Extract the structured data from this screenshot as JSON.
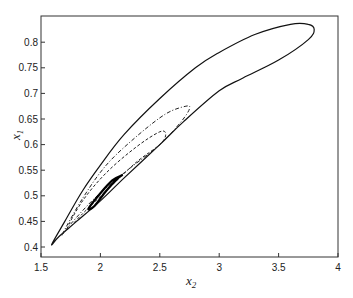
{
  "chart_data": {
    "type": "line",
    "title": "",
    "xlabel": "x",
    "xlabel_sub": "2",
    "ylabel": "x",
    "ylabel_sub": "1",
    "xlim": [
      1.5,
      4
    ],
    "ylim": [
      0.38,
      0.85
    ],
    "xticks": [
      "1.5",
      "2",
      "2.5",
      "3",
      "3.5",
      "4"
    ],
    "xtick_values": [
      1.5,
      2,
      2.5,
      3,
      3.5,
      4
    ],
    "yticks": [
      "0.4",
      "0.45",
      "0.5",
      "0.55",
      "0.6",
      "0.65",
      "0.7",
      "0.75",
      "0.8"
    ],
    "ytick_values": [
      0.4,
      0.45,
      0.5,
      0.55,
      0.6,
      0.65,
      0.7,
      0.75,
      0.8
    ],
    "grid": false,
    "legend": null,
    "series": [
      {
        "name": "outer limit cycle (solid)",
        "style": "solid",
        "color": "#111111",
        "x": [
          1.59,
          1.7,
          1.85,
          2.0,
          2.2,
          2.5,
          2.8,
          3.0,
          3.3,
          3.6,
          3.75,
          3.8,
          3.75,
          3.5,
          3.2,
          3.0,
          2.7,
          2.5,
          2.2,
          2.0,
          1.8,
          1.65,
          1.59
        ],
        "y": [
          0.405,
          0.45,
          0.51,
          0.56,
          0.62,
          0.69,
          0.75,
          0.78,
          0.815,
          0.835,
          0.835,
          0.825,
          0.805,
          0.765,
          0.73,
          0.705,
          0.645,
          0.6,
          0.535,
          0.49,
          0.45,
          0.42,
          0.405
        ]
      },
      {
        "name": "dash-dot loop",
        "style": "dashdot",
        "color": "#222222",
        "x": [
          1.68,
          1.85,
          2.05,
          2.3,
          2.55,
          2.72,
          2.75,
          2.68,
          2.5,
          2.2,
          1.95,
          1.75,
          1.68
        ],
        "y": [
          0.425,
          0.495,
          0.56,
          0.615,
          0.66,
          0.675,
          0.67,
          0.645,
          0.6,
          0.545,
          0.495,
          0.445,
          0.425
        ]
      },
      {
        "name": "dashed loop",
        "style": "dashed",
        "color": "#222222",
        "x": [
          1.72,
          1.85,
          2.05,
          2.3,
          2.5,
          2.55,
          2.5,
          2.3,
          2.05,
          1.85,
          1.72
        ],
        "y": [
          0.435,
          0.49,
          0.545,
          0.595,
          0.625,
          0.62,
          0.6,
          0.565,
          0.51,
          0.465,
          0.435
        ]
      },
      {
        "name": "inner loop (thick)",
        "style": "solid-thick",
        "color": "#000000",
        "x": [
          1.9,
          2.0,
          2.1,
          2.18,
          2.15,
          2.05,
          1.95,
          1.9
        ],
        "y": [
          0.475,
          0.505,
          0.53,
          0.54,
          0.535,
          0.51,
          0.48,
          0.475
        ]
      }
    ]
  },
  "colors": {
    "axis": "#333333",
    "background": "#ffffff"
  }
}
